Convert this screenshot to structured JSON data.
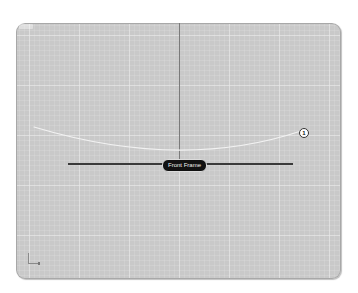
{
  "viewport": {
    "label": "",
    "background_color": "#c9c9c9",
    "grid_color": "#ebebeb"
  },
  "scene": {
    "frame_label": "Front Frame",
    "point_marker": "1",
    "curve_color": "#f2f2f2",
    "axis_color": "#3a3a3a"
  },
  "axes_widget": {
    "icon": "axes-orientation-icon"
  }
}
